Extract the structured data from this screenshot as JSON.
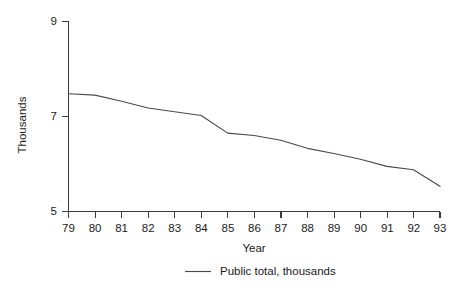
{
  "chart_data": {
    "type": "line",
    "title": "",
    "subtitle": "",
    "xlabel": "Year",
    "ylabel": "Thousands",
    "categories": [
      "79",
      "80",
      "81",
      "82",
      "83",
      "84",
      "85",
      "86",
      "87",
      "88",
      "89",
      "90",
      "91",
      "92",
      "93"
    ],
    "x": [
      79,
      80,
      81,
      82,
      83,
      84,
      85,
      86,
      87,
      88,
      89,
      90,
      91,
      92,
      93
    ],
    "xtick_labels": [
      "79",
      "80",
      "81",
      "82",
      "83",
      "84",
      "85",
      "86",
      "87",
      "88",
      "89",
      "90",
      "91",
      "92",
      "93"
    ],
    "ytick_labels": [
      "5",
      "7",
      "9"
    ],
    "yticks": [
      5,
      7,
      9
    ],
    "xlim": [
      79,
      93
    ],
    "ylim": [
      5,
      9
    ],
    "grid": false,
    "legend_position": "bottom-center",
    "series": [
      {
        "name": "Public total, thousands",
        "color": "#4a4a4a",
        "values": [
          7.48,
          7.45,
          7.32,
          7.18,
          7.1,
          7.02,
          6.65,
          6.6,
          6.5,
          6.33,
          6.22,
          6.1,
          5.95,
          5.88,
          5.53
        ]
      }
    ],
    "legend": [
      {
        "label": "Public total, thousands",
        "color": "#4a4a4a",
        "marker": "line"
      }
    ],
    "annotations": []
  },
  "axes": {
    "y_title": "Thousands",
    "x_title": "Year",
    "y_labels": {
      "top": "9",
      "middle": "7",
      "bottom": "5"
    }
  },
  "legend": {
    "entry_label": "Public total, thousands"
  },
  "colors": {
    "series": "#4a4a4a",
    "axis": "#3b3b3b",
    "text": "#1a1a1a",
    "background": "#ffffff"
  }
}
